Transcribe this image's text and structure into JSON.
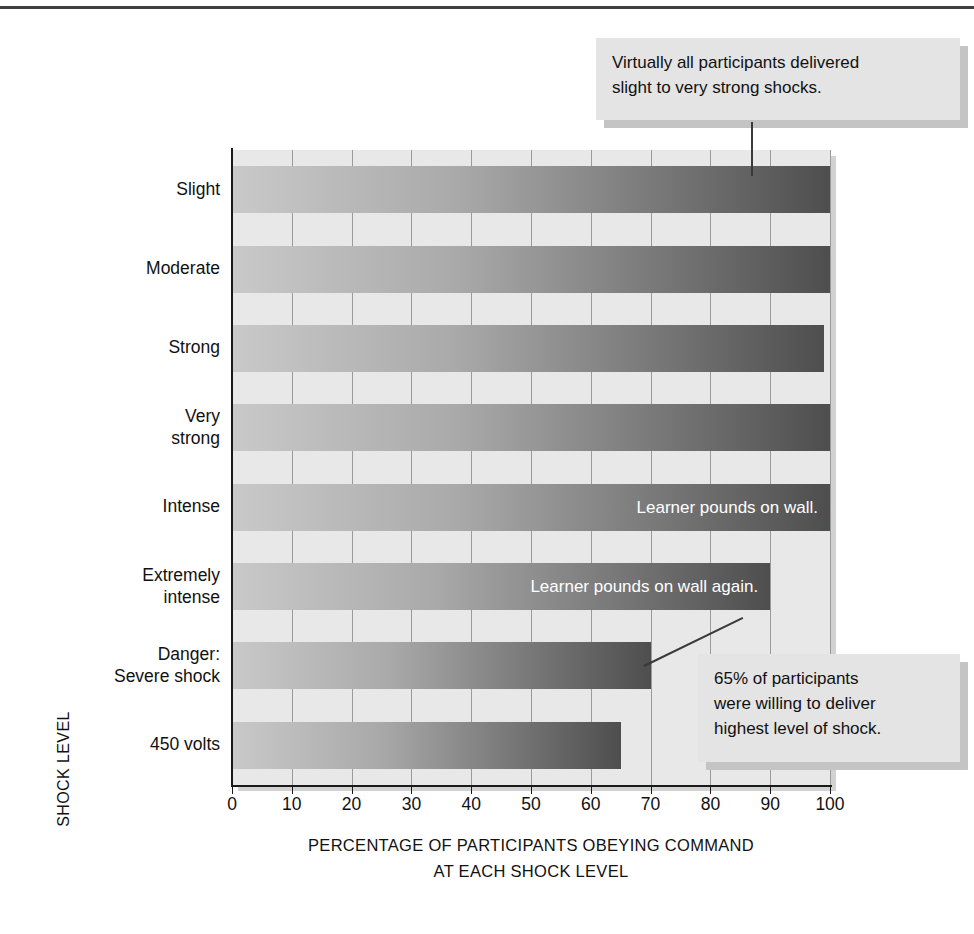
{
  "chart_data": {
    "type": "bar",
    "orientation": "horizontal",
    "title": "",
    "xlabel": "PERCENTAGE OF PARTICIPANTS OBEYING COMMAND AT EACH SHOCK LEVEL",
    "xlabel_lines": [
      "PERCENTAGE OF PARTICIPANTS OBEYING COMMAND",
      "AT EACH SHOCK LEVEL"
    ],
    "ylabel": "SHOCK LEVEL",
    "categories": [
      "Slight",
      "Moderate",
      "Strong",
      "Very strong",
      "Intense",
      "Extremely intense",
      "Danger: Severe shock",
      "450 volts"
    ],
    "category_lines": [
      [
        "Slight"
      ],
      [
        "Moderate"
      ],
      [
        "Strong"
      ],
      [
        "Very",
        "strong"
      ],
      [
        "Intense"
      ],
      [
        "Extremely",
        "intense"
      ],
      [
        "Danger:",
        "Severe shock"
      ],
      [
        "450 volts"
      ]
    ],
    "values": [
      100,
      100,
      99,
      100,
      100,
      90,
      70,
      65
    ],
    "xlim": [
      0,
      100
    ],
    "xticks": [
      0,
      10,
      20,
      30,
      40,
      50,
      60,
      70,
      80,
      90,
      100
    ],
    "xtick_labels": [
      "0",
      "10",
      "20",
      "30",
      "40",
      "50",
      "60",
      "70",
      "80",
      "90",
      "100"
    ],
    "grid": true,
    "grid_axis": "x",
    "legend": "none",
    "bar_colors": {
      "gradient_start": "#c9c9c9",
      "gradient_end": "#4e4e4e",
      "plot_background": "#e8e8e8",
      "gridline": "#9a9a9a",
      "axis": "#1a1a1a"
    },
    "bar_annotations": [
      {
        "category": "Intense",
        "text": "Learner pounds on wall."
      },
      {
        "category": "Extremely intense",
        "text": "Learner pounds on wall again."
      }
    ],
    "callouts": [
      {
        "id": "top-callout",
        "lines": [
          "Virtually all participants delivered",
          "slight to very strong shocks."
        ],
        "points_to": "Slight"
      },
      {
        "id": "bottom-callout",
        "lines": [
          "65% of participants",
          "were willing to deliver",
          "highest level of shock."
        ],
        "points_to": "450 volts"
      }
    ]
  }
}
